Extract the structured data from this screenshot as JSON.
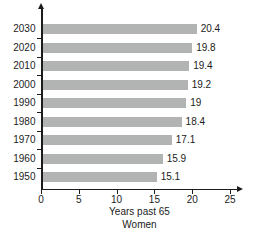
{
  "chart_data": {
    "type": "bar",
    "orientation": "horizontal",
    "categories": [
      "2030",
      "2020",
      "2010",
      "2000",
      "1990",
      "1980",
      "1970",
      "1960",
      "1950"
    ],
    "values": [
      20.4,
      19.8,
      19.4,
      19.2,
      19,
      18.4,
      17.1,
      15.9,
      15.1
    ],
    "value_labels": [
      "20.4",
      "19.8",
      "19.4",
      "19.2",
      "19",
      "18.4",
      "17.1",
      "15.9",
      "15.1"
    ],
    "xticks": [
      0,
      5,
      10,
      15,
      20,
      25
    ],
    "xtick_labels": [
      "0",
      "5",
      "10",
      "15",
      "20",
      "25"
    ],
    "xlim": [
      0,
      25
    ],
    "xlabel": "Years past 65",
    "sublabel": "Women",
    "title": "",
    "legend": null,
    "grid": false,
    "bar_color": "#b2b4b3",
    "axis_color": "#1c1c1c"
  }
}
